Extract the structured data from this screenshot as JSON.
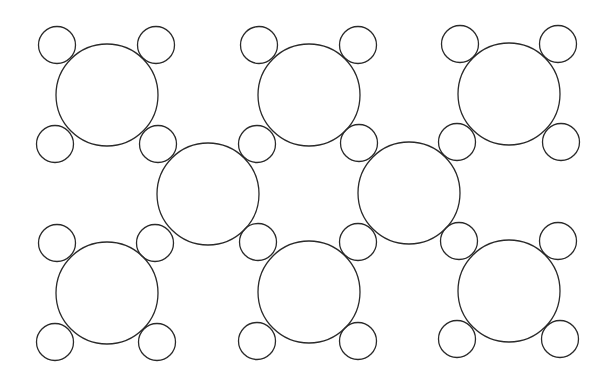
{
  "diagram": {
    "type": "circle-packing-pattern",
    "canvas": {
      "width": 607,
      "height": 383,
      "background": "#ffffff"
    },
    "stroke_color": "#2a2a2a",
    "large_circle_radius": 51,
    "small_circle_radius": 18.5,
    "large_circles": [
      {
        "cx": 107,
        "cy": 95
      },
      {
        "cx": 309,
        "cy": 95
      },
      {
        "cx": 509,
        "cy": 94
      },
      {
        "cx": 208,
        "cy": 194
      },
      {
        "cx": 409,
        "cy": 193
      },
      {
        "cx": 107,
        "cy": 293
      },
      {
        "cx": 309,
        "cy": 292
      },
      {
        "cx": 509,
        "cy": 291
      }
    ],
    "small_circles": [
      {
        "cx": 57,
        "cy": 45
      },
      {
        "cx": 156,
        "cy": 45
      },
      {
        "cx": 259,
        "cy": 45
      },
      {
        "cx": 358,
        "cy": 45
      },
      {
        "cx": 460,
        "cy": 44
      },
      {
        "cx": 558,
        "cy": 44
      },
      {
        "cx": 55,
        "cy": 144
      },
      {
        "cx": 158,
        "cy": 144
      },
      {
        "cx": 257,
        "cy": 144
      },
      {
        "cx": 359,
        "cy": 143
      },
      {
        "cx": 457,
        "cy": 142
      },
      {
        "cx": 561,
        "cy": 142
      },
      {
        "cx": 57,
        "cy": 243
      },
      {
        "cx": 155,
        "cy": 243
      },
      {
        "cx": 258,
        "cy": 242
      },
      {
        "cx": 358,
        "cy": 242
      },
      {
        "cx": 459,
        "cy": 241
      },
      {
        "cx": 558,
        "cy": 241
      },
      {
        "cx": 55,
        "cy": 342
      },
      {
        "cx": 157,
        "cy": 342
      },
      {
        "cx": 257,
        "cy": 341
      },
      {
        "cx": 358,
        "cy": 341
      },
      {
        "cx": 457,
        "cy": 339
      },
      {
        "cx": 560,
        "cy": 339
      }
    ]
  }
}
